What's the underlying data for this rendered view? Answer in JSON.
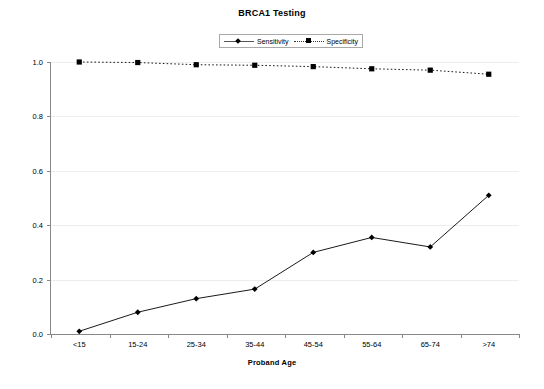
{
  "chart_data": {
    "type": "line",
    "title": "BRCA1 Testing",
    "xlabel": "Proband Age",
    "ylabel": "",
    "categories": [
      "<15",
      "15-24",
      "25-34",
      "35-44",
      "45-54",
      "55-64",
      "65-74",
      ">74"
    ],
    "series": [
      {
        "name": "Sensitivity",
        "marker": "diamond",
        "linestyle": "solid",
        "color": "#000000",
        "values": [
          0.01,
          0.08,
          0.13,
          0.165,
          0.3,
          0.355,
          0.32,
          0.51
        ]
      },
      {
        "name": "Specificity",
        "marker": "square",
        "linestyle": "dotted",
        "color": "#000000",
        "values": [
          1.0,
          0.998,
          0.99,
          0.988,
          0.983,
          0.975,
          0.97,
          0.955
        ]
      }
    ],
    "ylim": [
      0.0,
      1.0
    ],
    "ytick_labels": [
      "0.0",
      "0.2",
      "0.4",
      "0.6",
      "0.8",
      "1.0"
    ],
    "ytick_values": [
      0.0,
      0.2,
      0.4,
      0.6,
      0.8,
      1.0
    ],
    "grid": true,
    "grid_color": "#ededed",
    "legend_position": "top-center",
    "axis_color": "#888888",
    "background": "#ffffff"
  }
}
